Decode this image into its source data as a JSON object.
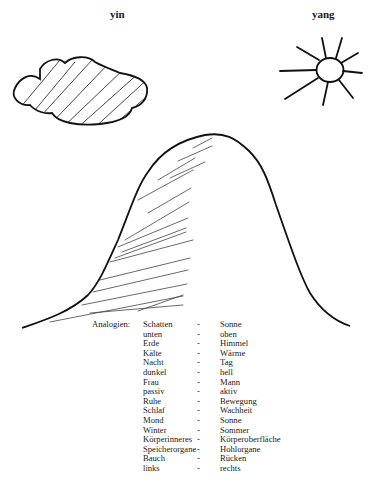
{
  "labels": {
    "yin": "yin",
    "yang": "yang"
  },
  "icons": {
    "yin_symbol": "cloud-icon",
    "yang_symbol": "sun-icon",
    "main_figure": "bell-curve-mountain"
  },
  "analogies": {
    "heading": "Analogien:",
    "separator": "-",
    "rows": [
      {
        "yin": "Schatten",
        "yang": "Sonne"
      },
      {
        "yin": "unten",
        "yang": "oben"
      },
      {
        "yin": "Erde",
        "yang": "Himmel"
      },
      {
        "yin": "Kälte",
        "yang": "Wärme"
      },
      {
        "yin": "Nacht",
        "yang": "Tag"
      },
      {
        "yin": "dunkel",
        "yang": "hell"
      },
      {
        "yin": "Frau",
        "yang": "Mann"
      },
      {
        "yin": "passiv",
        "yang": "aktiv"
      },
      {
        "yin": "Ruhe",
        "yang": "Bewegung"
      },
      {
        "yin": "Schlaf",
        "yang": "Wachheit"
      },
      {
        "yin": "Mond",
        "yang": "Sonne"
      },
      {
        "yin": "Winter",
        "yang": "Sommer"
      },
      {
        "yin": "Körperinneres",
        "yang": "Körperoberfläche"
      },
      {
        "yin": "Speicherorgane",
        "yang": "Hohlorgane"
      },
      {
        "yin": "Bauch",
        "yang": "Rücken"
      },
      {
        "yin": "links",
        "yang": "rechts"
      }
    ]
  }
}
